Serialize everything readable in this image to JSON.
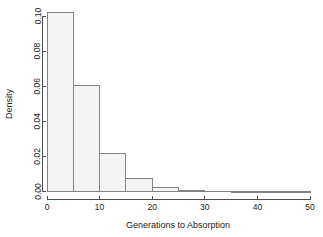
{
  "chart_data": {
    "type": "bar",
    "title": "",
    "subtitle": "",
    "xlabel": "Generations to Absorption",
    "ylabel": "Density",
    "xlim": [
      0,
      50
    ],
    "ylim": [
      0,
      0.102
    ],
    "grid": false,
    "legend": null,
    "bin_width": 5,
    "bin_edges": [
      0,
      5,
      10,
      15,
      20,
      25,
      30,
      35,
      40,
      45,
      50
    ],
    "categories": [
      "0-5",
      "5-10",
      "10-15",
      "15-20",
      "20-25",
      "25-30",
      "30-35",
      "35-40",
      "40-45",
      "45-50"
    ],
    "values": [
      0.102,
      0.0605,
      0.0215,
      0.0075,
      0.0025,
      0.0008,
      0.0002,
      0.0,
      0.0,
      0.0
    ],
    "x_ticks": [
      0,
      10,
      20,
      30,
      40,
      50
    ],
    "x_tick_labels": [
      "0",
      "10",
      "20",
      "30",
      "40",
      "50"
    ],
    "y_ticks": [
      0.0,
      0.02,
      0.04,
      0.06,
      0.08,
      0.1
    ],
    "y_tick_labels": [
      "0.00",
      "0.02",
      "0.04",
      "0.06",
      "0.08",
      "0.10"
    ],
    "bar_fill_color": "#f4f4f4",
    "bar_border_color": "#848484",
    "axis_color": "#4d4d4d",
    "background_color": "#ffffff"
  }
}
